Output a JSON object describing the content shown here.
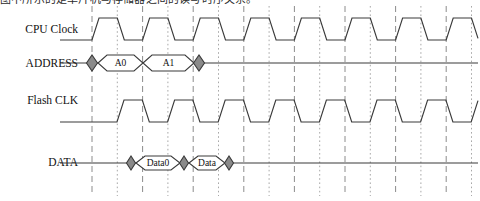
{
  "caption": {
    "text": "图中所示的是单片机与存储器之间的读写时序关系。"
  },
  "diagram": {
    "width": 480,
    "height": 201,
    "colors": {
      "waveform": "#3a3a3a",
      "diamond_fill": "#8a8a8a",
      "bubble_fill": "#ffffff",
      "grid_dashed": "#8c8c8c",
      "grid_dotted": "#a8a8a8",
      "text": "#111111",
      "background": "#ffffff"
    },
    "grid": {
      "start_x": 92,
      "spacing": 25.3,
      "count": 16,
      "top": 6,
      "bottom": 196,
      "pattern": [
        "dashed",
        "dotted"
      ]
    },
    "signals": [
      {
        "name": "cpu-clock",
        "label": "CPU Clock",
        "label_x": 78,
        "label_y": 33,
        "type": "clock",
        "baseline_y": 40,
        "high_y": 18,
        "low_y": 40,
        "lead_x": 60,
        "start_x": 92,
        "end_x": 478,
        "period": 50.6,
        "phase": 0,
        "edge_slope": 7
      },
      {
        "name": "address",
        "label": "ADDRESS",
        "label_x": 78,
        "label_y": 67,
        "type": "bus",
        "center_y": 63,
        "half_height": 8,
        "lead_x": 60,
        "start_x": 92,
        "end_x": 478
      },
      {
        "name": "flash-clk",
        "label": "Flash CLK",
        "label_x": 78,
        "label_y": 104,
        "type": "clock",
        "baseline_y": 122,
        "high_y": 100,
        "low_y": 122,
        "lead_x": 60,
        "start_x": 92,
        "end_x": 478,
        "period": 50.6,
        "phase": 25,
        "edge_slope": 7
      },
      {
        "name": "data",
        "label": "DATA",
        "label_x": 78,
        "label_y": 166,
        "type": "bus",
        "center_y": 163,
        "half_height": 7,
        "lead_x": 60,
        "start_x": 92,
        "end_x": 478
      }
    ],
    "address_markers": [
      {
        "name": "address-diamond-start",
        "x": 92,
        "kind": "diamond",
        "width": 11
      },
      {
        "name": "address-bubble-a0",
        "label": "A0",
        "x_start": 98,
        "x_end": 143,
        "kind": "bubble"
      },
      {
        "name": "address-bubble-a1",
        "label": "A1",
        "x_start": 143,
        "x_end": 194,
        "kind": "bubble"
      },
      {
        "name": "address-diamond-end",
        "x": 199,
        "kind": "diamond",
        "width": 11
      }
    ],
    "data_markers": [
      {
        "name": "data-diamond-1",
        "x": 131,
        "kind": "diamond",
        "width": 9
      },
      {
        "name": "data-bubble-data0",
        "label": "Data0",
        "x_start": 136,
        "x_end": 180,
        "kind": "bubble"
      },
      {
        "name": "data-diamond-2",
        "x": 184,
        "kind": "diamond",
        "width": 9
      },
      {
        "name": "data-bubble-data1",
        "label": "Data",
        "x_start": 189,
        "x_end": 225,
        "kind": "bubble"
      },
      {
        "name": "data-diamond-3",
        "x": 229,
        "kind": "diamond",
        "width": 9
      }
    ]
  }
}
